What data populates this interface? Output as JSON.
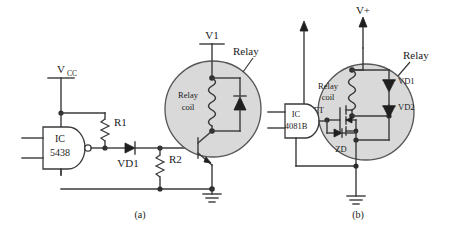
{
  "figure": {
    "background_color": "#ffffff",
    "line_color": "#3a3a3a",
    "relay_fill_color": "#d9d9d9",
    "panels": [
      {
        "id": "a",
        "caption": "(a)",
        "supply_label": "V",
        "supply_sublabel": "CC",
        "rail_label": "V1",
        "ic_line1": "IC",
        "ic_line2": "5438",
        "ic_type": "nand-gate",
        "components": [
          {
            "name": "R1",
            "label": "R1",
            "type": "resistor"
          },
          {
            "name": "R2",
            "label": "R2",
            "type": "resistor"
          },
          {
            "name": "VD1",
            "label": "VD1",
            "type": "diode"
          },
          {
            "name": "relay-coil",
            "label_line1": "Relay",
            "label_line2": "coil",
            "type": "coil"
          },
          {
            "name": "relay",
            "label": "Relay",
            "type": "relay-boundary"
          },
          {
            "name": "flyback-diode",
            "label": "",
            "type": "diode"
          },
          {
            "name": "transistor",
            "label": "",
            "type": "npn-transistor"
          },
          {
            "name": "ground",
            "label": "",
            "type": "ground"
          }
        ]
      },
      {
        "id": "b",
        "caption": "(b)",
        "supply_label": "V+",
        "ic_line1": "IC",
        "ic_line2": "4081B",
        "ic_type": "and-gate",
        "components": [
          {
            "name": "relay-coil",
            "label_line1": "Relay",
            "label_line2": "coil",
            "type": "coil"
          },
          {
            "name": "relay",
            "label": "Relay",
            "type": "relay-boundary"
          },
          {
            "name": "VD1",
            "label": "VD1",
            "type": "zener-diode"
          },
          {
            "name": "VD2",
            "label": "VD2",
            "type": "zener-diode"
          },
          {
            "name": "FET",
            "label": "FET",
            "type": "mosfet"
          },
          {
            "name": "ZD",
            "label": "ZD",
            "type": "zener-diode"
          },
          {
            "name": "ground",
            "label": "",
            "type": "ground"
          }
        ]
      }
    ]
  },
  "labels": {
    "a_vcc": "V",
    "a_vcc_sub": "CC",
    "a_v1": "V1",
    "a_relay": "Relay",
    "a_relay_coil_1": "Relay",
    "a_relay_coil_2": "coil",
    "a_ic_1": "IC",
    "a_ic_2": "5438",
    "a_r1": "R1",
    "a_r2": "R2",
    "a_vd1": "VD1",
    "a_caption": "(a)",
    "b_vplus": "V+",
    "b_relay": "Relay",
    "b_relay_coil_1": "Relay",
    "b_relay_coil_2": "coil",
    "b_ic_1": "IC",
    "b_ic_2": "4081B",
    "b_vd1": "VD1",
    "b_vd2": "VD2",
    "b_fet": "FET",
    "b_zd": "ZD",
    "b_caption": "(b)"
  }
}
